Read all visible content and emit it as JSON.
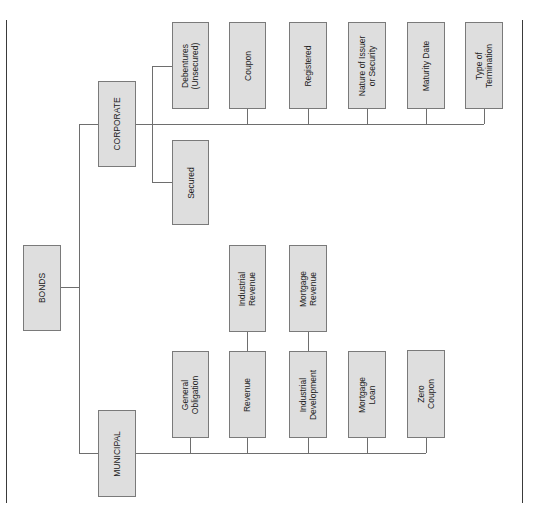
{
  "diagram": {
    "root": "BONDS",
    "branches": {
      "corporate": {
        "label": "CORPORATE",
        "secured_types": [
          "Debentures\n(Unsecured)",
          "Secured"
        ],
        "features": [
          "Coupon",
          "Registered",
          "Nature of Issuer\nor Security",
          "Maturity Date",
          "Type of\nTermination"
        ]
      },
      "municipal": {
        "label": "MUNICIPAL",
        "types": [
          "General\nObligation",
          "Revenue",
          "Industrial\nDevelopment",
          "Mortgage\nLoan",
          "Zero\nCoupon"
        ],
        "sub": {
          "revenue": "Industrial\nRevenue",
          "industrial_development": "Mortgage\nRevenue"
        }
      }
    },
    "colors": {
      "box_fill": "#dedede",
      "box_border": "#7a7a7a",
      "line": "#6e6e6e",
      "rule": "#3a3a3a"
    }
  }
}
